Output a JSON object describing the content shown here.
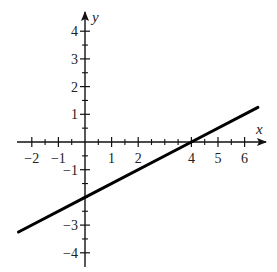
{
  "chart_data": {
    "type": "line",
    "title": "",
    "xlabel": "x",
    "ylabel": "y",
    "xlim": [
      -2.5,
      6.6
    ],
    "ylim": [
      -4.5,
      4.6
    ],
    "grid": false,
    "x_ticks": [
      -2,
      -1,
      1,
      2,
      4,
      5,
      6
    ],
    "x_minor_ticks": [
      -1.5,
      -0.5,
      0.5,
      1.5,
      2.5,
      3,
      3.5,
      4.5,
      5.5
    ],
    "y_ticks": [
      4,
      3,
      2,
      1,
      -1,
      -3,
      -4
    ],
    "y_minor_ticks": [
      3.5,
      2.5,
      1.5,
      0.5,
      -0.5,
      -1.5,
      -2,
      -2.5,
      -3.5
    ],
    "series": [
      {
        "name": "line",
        "equation": "y = 0.5x - 2",
        "x": [
          -2.5,
          0,
          4,
          6.5
        ],
        "y": [
          -3.25,
          -2,
          0,
          1.25
        ],
        "color": "#000000"
      }
    ]
  },
  "layout": {
    "origin_px": [
      85,
      142
    ],
    "unit_x_px": 26.6,
    "unit_y_px": 27.7
  }
}
